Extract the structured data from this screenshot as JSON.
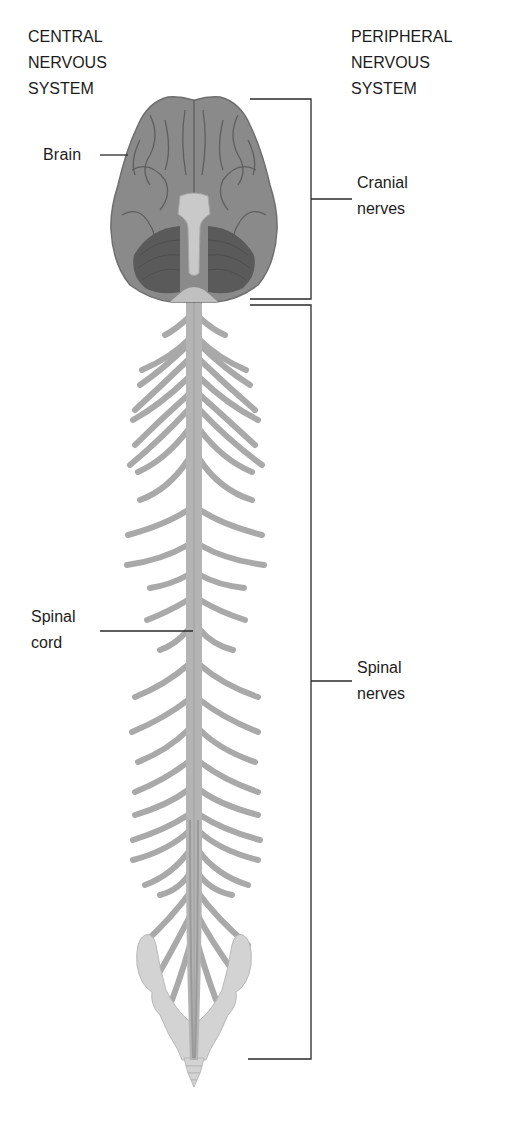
{
  "figure": {
    "central_header": [
      "CENTRAL",
      "NERVOUS",
      "SYSTEM"
    ],
    "peripheral_header": [
      "PERIPHERAL",
      "NERVOUS",
      "SYSTEM"
    ],
    "labels": {
      "brain": "Brain",
      "spinal_cord": [
        "Spinal",
        "cord"
      ],
      "cranial_nerves": [
        "Cranial",
        "nerves"
      ],
      "spinal_nerves": [
        "Spinal",
        "nerves"
      ]
    },
    "colors": {
      "brain": "#8a8a8a",
      "brain_sulci": "#5e5e5e",
      "cerebellum": "#5a5a5a",
      "cord": "#b4b4b4",
      "nerves": "#a9a9a9",
      "pelvis": "#d3d3d3",
      "line": "#2a2a2a"
    }
  }
}
